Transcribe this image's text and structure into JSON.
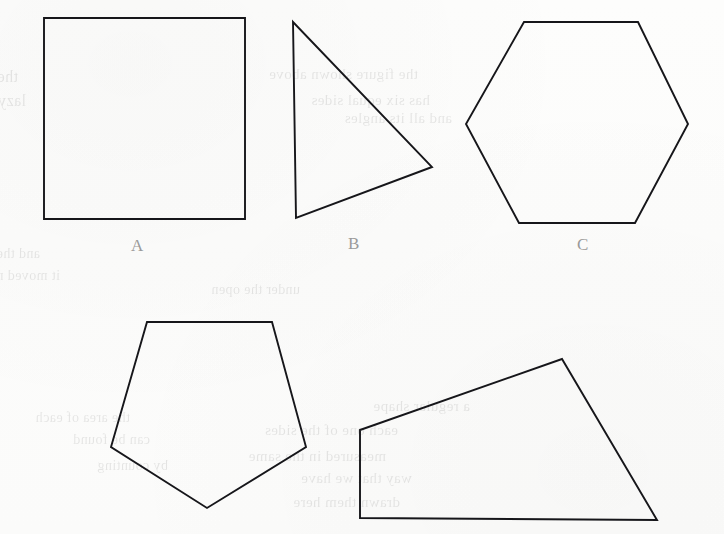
{
  "page": {
    "width": 724,
    "height": 534,
    "background_color": "#fefefe",
    "stroke_color": "#16161a",
    "label_color": "#9a9a9a"
  },
  "figure": {
    "shapes": [
      {
        "id": "shape-a",
        "label": "A",
        "name": "square",
        "sides": 4,
        "points": "44,18 245,18 245,219 44,219",
        "label_x": 131,
        "label_y": 237
      },
      {
        "id": "shape-b",
        "label": "B",
        "name": "triangle",
        "sides": 3,
        "points": "293,22 432,167 296,218",
        "label_x": 348,
        "label_y": 235
      },
      {
        "id": "shape-c",
        "label": "C",
        "name": "hexagon",
        "sides": 6,
        "points": "524,22 638,22 688,124 635,223 519,223 466,124",
        "label_x": 577,
        "label_y": 236
      },
      {
        "id": "shape-d",
        "label": "",
        "name": "pentagon",
        "sides": 5,
        "points": "147,322 272,322 306,447 207,508 111,447",
        "label_x": null,
        "label_y": null
      },
      {
        "id": "shape-e",
        "label": "",
        "name": "quadrilateral",
        "sides": 4,
        "points": "360,430 562,359 657,520 360,518",
        "label_x": null,
        "label_y": null
      }
    ],
    "labels": [
      {
        "text": "A",
        "x": 131,
        "y": 237
      },
      {
        "text": "B",
        "x": 348,
        "y": 235
      },
      {
        "text": "C",
        "x": 577,
        "y": 236
      }
    ]
  },
  "bleed_through": {
    "note": "Mirrored ghost text from the opposite side of the page, barely legible.",
    "lines": [
      {
        "text": "the brown fox jumps over",
        "x": 18,
        "y": 68,
        "size": 16
      },
      {
        "text": "lazy dog and walks home",
        "x": 26,
        "y": 92,
        "size": 16
      },
      {
        "text": "and the circle was round",
        "x": 40,
        "y": 246,
        "size": 14
      },
      {
        "text": "it moved near the line",
        "x": 60,
        "y": 268,
        "size": 14
      },
      {
        "text": "under the open",
        "x": 300,
        "y": 282,
        "size": 14
      },
      {
        "text": "the figure shown above",
        "x": 418,
        "y": 66,
        "size": 15
      },
      {
        "text": "has six equal sides",
        "x": 430,
        "y": 92,
        "size": 15
      },
      {
        "text": "and all its angles",
        "x": 452,
        "y": 110,
        "size": 15
      },
      {
        "text": "a regular shape",
        "x": 470,
        "y": 398,
        "size": 15
      },
      {
        "text": "each one of the sides",
        "x": 398,
        "y": 422,
        "size": 15
      },
      {
        "text": "measured in the same",
        "x": 386,
        "y": 448,
        "size": 15
      },
      {
        "text": "way that we have",
        "x": 412,
        "y": 470,
        "size": 15
      },
      {
        "text": "drawn them here",
        "x": 400,
        "y": 494,
        "size": 15
      },
      {
        "text": "the area of each",
        "x": 130,
        "y": 410,
        "size": 14
      },
      {
        "text": "can be found",
        "x": 150,
        "y": 432,
        "size": 14
      },
      {
        "text": "by counting",
        "x": 168,
        "y": 458,
        "size": 14
      }
    ]
  }
}
